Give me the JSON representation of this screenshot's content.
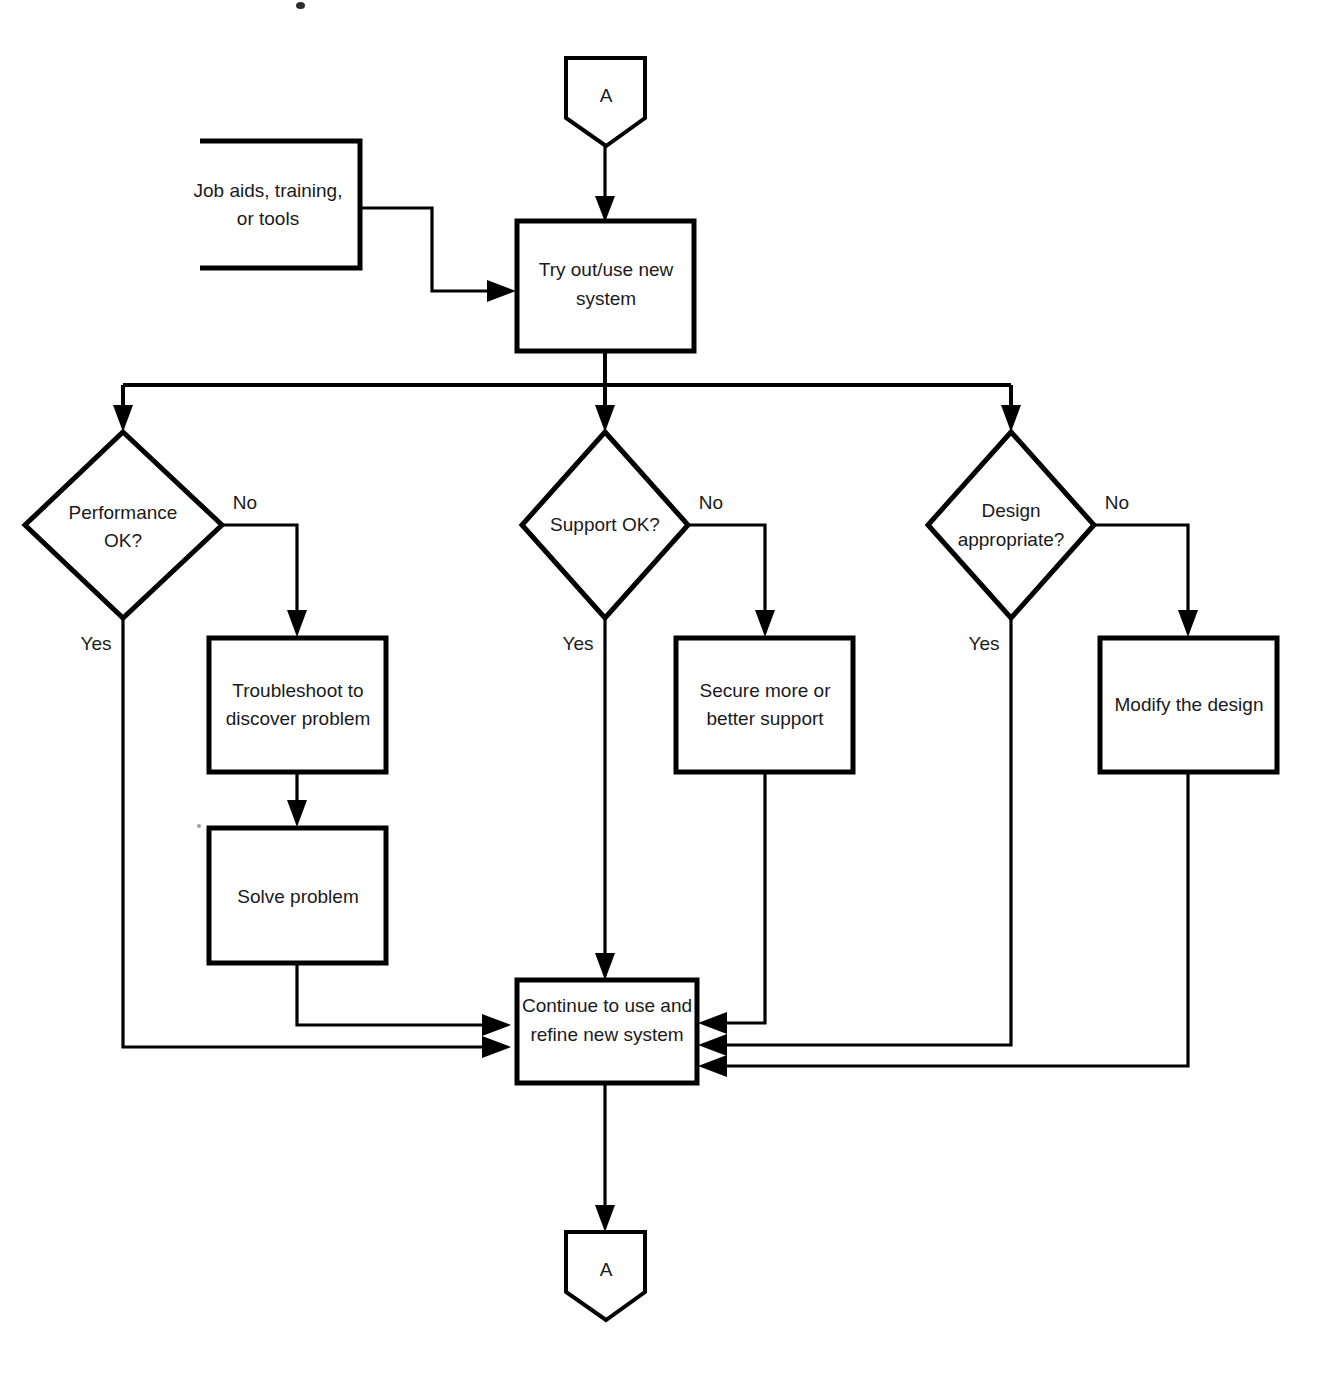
{
  "diagram": {
    "type": "flowchart",
    "title": "",
    "orientation": "top-to-bottom",
    "nodes": [
      {
        "id": "connector-a-top",
        "shape": "pentagon-connector",
        "label": "A"
      },
      {
        "id": "job-aids",
        "shape": "open-left-resource",
        "label_line1": "Job aids, training,",
        "label_line2": "or tools"
      },
      {
        "id": "try-out",
        "shape": "process",
        "label_line1": "Try out/use new",
        "label_line2": "system"
      },
      {
        "id": "performance-ok",
        "shape": "decision",
        "label_line1": "Performance",
        "label_line2": "OK?"
      },
      {
        "id": "support-ok",
        "shape": "decision",
        "label_line1": "Support OK?",
        "label_line2": ""
      },
      {
        "id": "design-appropriate",
        "shape": "decision",
        "label_line1": "Design",
        "label_line2": "appropriate?"
      },
      {
        "id": "troubleshoot",
        "shape": "process",
        "label_line1": "Troubleshoot to",
        "label_line2": "discover problem"
      },
      {
        "id": "solve-problem",
        "shape": "process",
        "label_line1": "Solve problem",
        "label_line2": ""
      },
      {
        "id": "secure-support",
        "shape": "process",
        "label_line1": "Secure more or",
        "label_line2": "better support"
      },
      {
        "id": "modify-design",
        "shape": "process",
        "label_line1": "Modify the design",
        "label_line2": ""
      },
      {
        "id": "continue-use",
        "shape": "process",
        "label_line1": "Continue to use and",
        "label_line2": "refine new system"
      },
      {
        "id": "connector-a-bottom",
        "shape": "pentagon-connector",
        "label": "A"
      }
    ],
    "edge_labels": {
      "performance_no": "No",
      "performance_yes": "Yes",
      "support_no": "No",
      "support_yes": "Yes",
      "design_no": "No",
      "design_yes": "Yes"
    },
    "colors": {
      "stroke": "#000000",
      "fill": "#ffffff",
      "text": "#1a1a1a",
      "background": "#ffffff"
    }
  }
}
